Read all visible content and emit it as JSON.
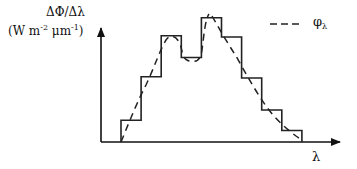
{
  "diagram": {
    "y_axis_label_top": "ΔΦ/Δλ",
    "y_axis_unit_prefix": "(W m",
    "y_axis_unit_exp1": "-2",
    "y_axis_unit_mid": " μm",
    "y_axis_unit_exp2": "-1",
    "y_axis_unit_suffix": ")",
    "x_axis_label": "λ",
    "legend": {
      "line_style": "dashed",
      "symbol": "φ",
      "subscript": "λ"
    },
    "histogram_bins_relative_height": [
      0.17,
      0.51,
      0.83,
      0.66,
      0.97,
      0.82,
      0.5,
      0.25,
      0.09
    ],
    "line_color": "#222222"
  }
}
